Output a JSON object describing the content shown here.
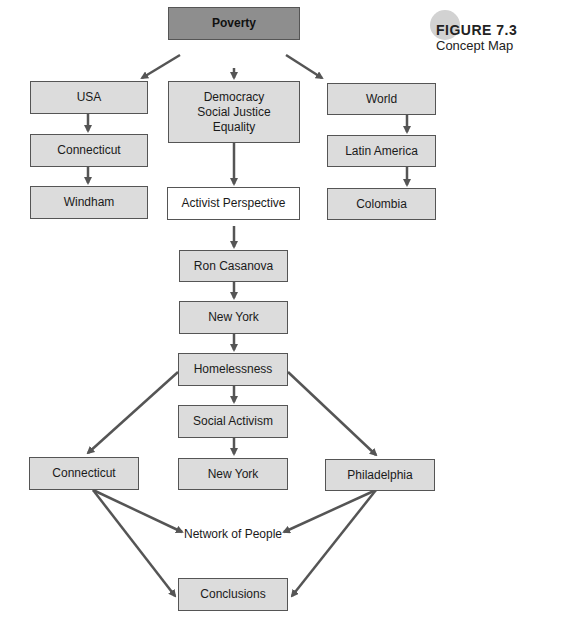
{
  "figure": {
    "number": "FIGURE 7.3",
    "caption": "Concept Map"
  },
  "nodes": {
    "poverty": "Poverty",
    "usa": "USA",
    "values_1": "Democracy",
    "values_2": "Social Justice",
    "values_3": "Equality",
    "world": "World",
    "connecticut_top": "Connecticut",
    "latin_america": "Latin America",
    "windham": "Windham",
    "activist": "Activist Perspective",
    "colombia": "Colombia",
    "ron": "Ron Casanova",
    "new_york_1": "New York",
    "homelessness": "Homelessness",
    "social_activism": "Social Activism",
    "connecticut_bottom": "Connecticut",
    "new_york_2": "New York",
    "philadelphia": "Philadelphia",
    "network": "Network of People",
    "conclusions": "Conclusions"
  },
  "colors": {
    "box_fill": "#dcdcdc",
    "root_fill": "#8e8e8e",
    "stroke": "#555555"
  }
}
